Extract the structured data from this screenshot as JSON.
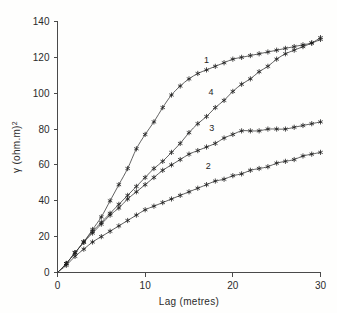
{
  "chart_data": {
    "type": "line",
    "title": "",
    "subtitle": "",
    "xlabel": "Lag (metres)",
    "ylabel": "γ (ohm.m)²",
    "ylabel_base": "γ (ohm.m)",
    "ylabel_exponent": "2",
    "xlim": [
      0,
      30
    ],
    "ylim": [
      0,
      140
    ],
    "xticks": [
      0,
      10,
      20,
      30
    ],
    "yticks": [
      0,
      20,
      40,
      60,
      80,
      100,
      120,
      140
    ],
    "xtick_labels": [
      "0",
      "10",
      "20",
      "30"
    ],
    "ytick_labels": [
      "0",
      "20",
      "40",
      "60",
      "80",
      "100",
      "120",
      "140"
    ],
    "grid": false,
    "legend_position": "inline-curve-labels",
    "marker": "asterisk",
    "line_color": "#3a3a3a",
    "marker_color": "#1f1f1f",
    "axis_color": "#4a4a4a",
    "background_color": "#fefefd",
    "series": [
      {
        "name": "1",
        "label": "1",
        "label_x": 17.0,
        "label_y": 117.0,
        "x": [
          0,
          1,
          2,
          3,
          4,
          5,
          6,
          7,
          8,
          9,
          10,
          11,
          12,
          13,
          14,
          15,
          16,
          17,
          18,
          19,
          20,
          21,
          22,
          23,
          24,
          25,
          26,
          27,
          28,
          29,
          30
        ],
        "y": [
          0,
          5,
          11,
          17,
          24,
          31,
          40,
          49,
          58,
          69,
          77,
          84,
          92,
          99,
          104,
          108,
          111,
          113,
          115,
          117,
          119,
          120,
          121,
          122,
          123,
          124,
          125,
          126,
          127,
          128,
          130
        ]
      },
      {
        "name": "2",
        "label": "2",
        "label_x": 17.2,
        "label_y": 58.0,
        "x": [
          0,
          1,
          2,
          3,
          4,
          5,
          6,
          7,
          8,
          9,
          10,
          11,
          12,
          13,
          14,
          15,
          16,
          17,
          18,
          19,
          20,
          21,
          22,
          23,
          24,
          25,
          26,
          27,
          28,
          29,
          30
        ],
        "y": [
          0,
          4,
          9,
          13,
          17,
          20,
          23,
          26,
          29,
          32,
          35,
          37,
          39,
          41,
          43,
          45,
          47,
          49,
          51,
          52,
          54,
          55,
          57,
          58,
          59,
          61,
          62,
          63,
          65,
          66,
          67
        ]
      },
      {
        "name": "3",
        "label": "3",
        "label_x": 17.6,
        "label_y": 79.0,
        "x": [
          0,
          1,
          2,
          3,
          4,
          5,
          6,
          7,
          8,
          9,
          10,
          11,
          12,
          13,
          14,
          15,
          16,
          17,
          18,
          19,
          20,
          21,
          22,
          23,
          24,
          25,
          26,
          27,
          28,
          29,
          30
        ],
        "y": [
          0,
          5,
          11,
          17,
          22,
          27,
          32,
          36,
          41,
          45,
          49,
          53,
          57,
          60,
          63,
          66,
          68,
          70,
          72,
          75,
          77,
          79,
          79,
          79,
          80,
          80,
          80,
          81,
          82,
          83,
          84
        ]
      },
      {
        "name": "4",
        "label": "4",
        "label_x": 17.5,
        "label_y": 99.0,
        "x": [
          0,
          1,
          2,
          3,
          4,
          5,
          6,
          7,
          8,
          9,
          10,
          11,
          12,
          13,
          14,
          15,
          16,
          17,
          18,
          19,
          20,
          21,
          22,
          23,
          24,
          25,
          26,
          27,
          28,
          29,
          30
        ],
        "y": [
          0,
          5,
          11,
          17,
          23,
          28,
          33,
          38,
          43,
          48,
          53,
          58,
          62,
          67,
          72,
          78,
          83,
          87,
          92,
          96,
          101,
          105,
          108,
          112,
          115,
          119,
          122,
          124,
          126,
          128,
          131
        ]
      }
    ]
  }
}
